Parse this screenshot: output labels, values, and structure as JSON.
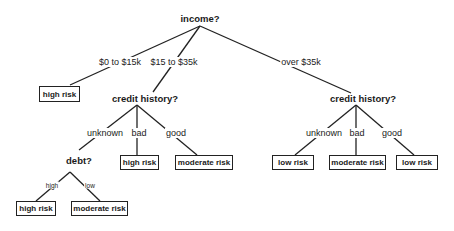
{
  "diagram": {
    "type": "decision-tree",
    "root": {
      "label": "income?"
    },
    "income_edges": [
      "$0 to $15k",
      "$15 to $35k",
      "over $35k"
    ],
    "nodes": {
      "income": "income?",
      "credit_left": "credit history?",
      "credit_right": "credit history?",
      "debt": "debt?"
    },
    "edge_labels": {
      "credit_left": [
        "unknown",
        "bad",
        "good"
      ],
      "credit_right": [
        "unknown",
        "bad",
        "good"
      ],
      "debt": [
        "high",
        "low"
      ]
    },
    "leaves": {
      "income_low": "high risk",
      "credit_left_bad": "high risk",
      "credit_left_good": "moderate risk",
      "debt_high": "high risk",
      "debt_low": "moderate risk",
      "credit_right_unknown": "low risk",
      "credit_right_bad": "moderate risk",
      "credit_right_good": "low risk"
    }
  }
}
